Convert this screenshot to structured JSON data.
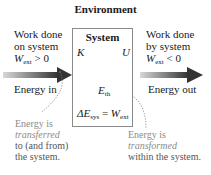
{
  "diagram": {
    "title": "Environment",
    "system": {
      "title": "System",
      "kinetic_label": "K",
      "potential_label": "U",
      "thermal_label": "E",
      "thermal_sub": "th",
      "equation": {
        "delta": "ΔE",
        "lhs_sub": "sys",
        "equals": " = ",
        "rhs": "W",
        "rhs_sub": "ext"
      }
    },
    "left": {
      "line1": "Work done",
      "line2": "on system",
      "w": "W",
      "w_sub": "ext",
      "w_rel": " > 0",
      "energy_label": "Energy in"
    },
    "right": {
      "line1": "Work done",
      "line2": "by system",
      "w": "W",
      "w_sub": "ext",
      "w_rel": " < 0",
      "energy_label": "Energy out"
    },
    "note_left": {
      "line1": "Energy is",
      "line2": "transferred",
      "line3": "to (and from)",
      "line4": "the system."
    },
    "note_right": {
      "line1": "Energy is",
      "line2": "transformed",
      "line3": "within the system."
    },
    "colors": {
      "arrow_dark": "#3a3a3a",
      "arrow_light": "#c8c8c8",
      "box_border": "#8a8a8a",
      "note_text": "#8c8c8c"
    }
  }
}
